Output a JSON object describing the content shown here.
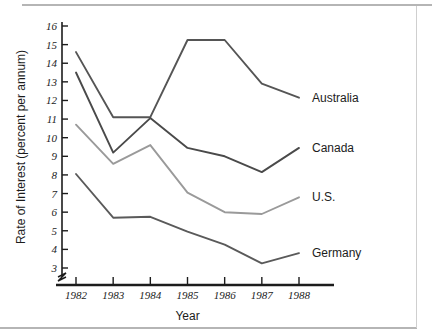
{
  "chart_data": {
    "type": "line",
    "title": "",
    "xlabel": "Year",
    "ylabel": "Rate of Interest (percent per annum)",
    "x": [
      1982,
      1983,
      1984,
      1985,
      1986,
      1987,
      1988
    ],
    "categories": [
      "1982",
      "1983",
      "1984",
      "1985",
      "1986",
      "1987",
      "1988"
    ],
    "xlim": [
      1982,
      1988
    ],
    "ylim": [
      3,
      16
    ],
    "yticks": [
      3,
      4,
      5,
      6,
      7,
      8,
      9,
      10,
      11,
      12,
      13,
      14,
      15,
      16
    ],
    "ytick_labels": [
      "3",
      "4",
      "5",
      "6",
      "7",
      "8",
      "9",
      "10",
      "11",
      "12",
      "13",
      "14",
      "15",
      "16"
    ],
    "xtick_labels": [
      "1982",
      "1983",
      "1984",
      "1985",
      "1986",
      "1987",
      "1988"
    ],
    "grid": false,
    "legend_position": "right-inline-labels",
    "axis_break": true,
    "axis_break_note": "y-axis broken below 3",
    "series": [
      {
        "name": "Australia",
        "label": "Australia",
        "color": "#555555",
        "values": [
          14.6,
          11.1,
          11.1,
          15.25,
          15.25,
          12.9,
          12.15
        ]
      },
      {
        "name": "Canada",
        "label": "Canada",
        "color": "#4a4a4a",
        "values": [
          13.5,
          9.2,
          11.05,
          9.45,
          9.0,
          8.15,
          9.45
        ]
      },
      {
        "name": "U.S.",
        "label": "U.S.",
        "color": "#9a9a9a",
        "values": [
          10.7,
          8.6,
          9.6,
          7.05,
          6.0,
          5.9,
          6.8
        ]
      },
      {
        "name": "Germany",
        "label": "Germany",
        "color": "#5a5a5a",
        "values": [
          8.05,
          5.7,
          5.75,
          4.95,
          4.25,
          3.25,
          3.8
        ]
      }
    ]
  },
  "colors": {
    "axis": "#1c1c1c",
    "text": "#1c1c1c",
    "rule": "#b5b5b5",
    "background": "#ffffff"
  }
}
